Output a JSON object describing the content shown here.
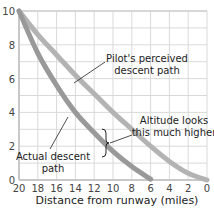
{
  "chart_data": {
    "type": "line",
    "title": "",
    "xlabel": "Distance from runway (miles)",
    "ylabel": "",
    "xlim": [
      20,
      0
    ],
    "ylim": [
      0,
      10
    ],
    "x_reversed": true,
    "grid": true,
    "x_ticks": [
      20,
      18,
      16,
      14,
      12,
      10,
      8,
      6,
      4,
      2,
      0
    ],
    "y_ticks": [
      0,
      2,
      4,
      6,
      8,
      10
    ],
    "series": [
      {
        "name": "Pilot's perceived descent path",
        "color": "#b3b3b3",
        "x": [
          20,
          18,
          16,
          14,
          12,
          10,
          8,
          6,
          4,
          2,
          0
        ],
        "y": [
          10,
          8.6,
          7.4,
          6.2,
          5.1,
          4.0,
          3.0,
          2.0,
          1.1,
          0.4,
          0
        ]
      },
      {
        "name": "Actual descent path",
        "color": "#999999",
        "x": [
          20,
          18,
          16,
          14,
          12,
          10,
          8,
          6
        ],
        "y": [
          10,
          7.5,
          5.6,
          4.0,
          2.8,
          1.7,
          0.8,
          0.05
        ]
      }
    ],
    "annotations": [
      {
        "text": [
          "Pilot's perceived",
          "descent path"
        ],
        "points_to": "perceived"
      },
      {
        "text": [
          "Actual descent",
          "path"
        ],
        "points_to": "actual"
      },
      {
        "text": [
          "Altitude looks",
          "this much higher"
        ],
        "points_to": "gap-bracket"
      }
    ]
  },
  "labels": {
    "xlabel": "Distance from runway (miles)",
    "perceived_line1": "Pilot's perceived",
    "perceived_line2": "descent path",
    "actual_line1": "Actual descent",
    "actual_line2": "path",
    "gap_line1": "Altitude looks",
    "gap_line2": "this much higher"
  }
}
